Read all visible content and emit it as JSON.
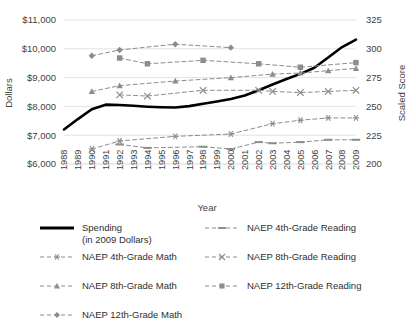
{
  "chart_data": {
    "type": "line",
    "title": "",
    "xlabel": "Year",
    "ylabel": "Dollars",
    "y2label": "Scaled Score",
    "grid": true,
    "legend_position": "bottom",
    "x": [
      1988,
      1989,
      1990,
      1991,
      1992,
      1993,
      1994,
      1995,
      1996,
      1997,
      1998,
      1999,
      2000,
      2001,
      2002,
      2003,
      2004,
      2005,
      2006,
      2007,
      2008,
      2009
    ],
    "xtick_labels": [
      "1988",
      "1989",
      "1990",
      "1991",
      "1992",
      "1993",
      "1994",
      "1995",
      "1996",
      "1997",
      "1998",
      "1999",
      "2000",
      "2001",
      "2002",
      "2003",
      "2004",
      "2005",
      "2006",
      "2007",
      "2008",
      "2009"
    ],
    "ylim": [
      6000,
      11000
    ],
    "ytick_values": [
      6000,
      7000,
      8000,
      9000,
      10000,
      11000
    ],
    "ytick_labels": [
      "$6,000",
      "$7,000",
      "$8,000",
      "$9,000",
      "$10,000",
      "$11,000"
    ],
    "y2lim": [
      200,
      325
    ],
    "y2tick_values": [
      200,
      225,
      250,
      275,
      300,
      325
    ],
    "y2tick_labels": [
      "200",
      "225",
      "250",
      "275",
      "300",
      "325"
    ],
    "series": [
      {
        "name": "Spending",
        "legend_label": "Spending",
        "legend_sublabel": "(in 2009 Dollars)",
        "axis": "left",
        "unit": "dollars",
        "style": "solid",
        "marker": "none",
        "color": "#000000",
        "width": 2.6,
        "points": [
          {
            "x": 1988,
            "y": 7200
          },
          {
            "x": 1989,
            "y": 7560
          },
          {
            "x": 1990,
            "y": 7900
          },
          {
            "x": 1991,
            "y": 8060
          },
          {
            "x": 1992,
            "y": 8050
          },
          {
            "x": 1993,
            "y": 8020
          },
          {
            "x": 1994,
            "y": 7990
          },
          {
            "x": 1995,
            "y": 7970
          },
          {
            "x": 1996,
            "y": 7960
          },
          {
            "x": 1997,
            "y": 8010
          },
          {
            "x": 1998,
            "y": 8090
          },
          {
            "x": 1999,
            "y": 8170
          },
          {
            "x": 2000,
            "y": 8260
          },
          {
            "x": 2001,
            "y": 8380
          },
          {
            "x": 2002,
            "y": 8560
          },
          {
            "x": 2003,
            "y": 8760
          },
          {
            "x": 2004,
            "y": 8950
          },
          {
            "x": 2005,
            "y": 9130
          },
          {
            "x": 2006,
            "y": 9340
          },
          {
            "x": 2007,
            "y": 9700
          },
          {
            "x": 2008,
            "y": 10060
          },
          {
            "x": 2009,
            "y": 10320
          }
        ]
      },
      {
        "name": "NAEP 12th-Grade Math",
        "legend_label": "NAEP 12th-Grade Math",
        "axis": "right",
        "unit": "score",
        "style": "dashed",
        "marker": "diamond",
        "color": "#8c8c8c",
        "width": 1,
        "points": [
          {
            "x": 1990,
            "y": 294
          },
          {
            "x": 1992,
            "y": 299
          },
          {
            "x": 1996,
            "y": 304
          },
          {
            "x": 2000,
            "y": 301
          }
        ]
      },
      {
        "name": "NAEP 12th-Grade Reading",
        "legend_label": "NAEP 12th-Grade Reading",
        "axis": "right",
        "unit": "score",
        "style": "dashed",
        "marker": "square",
        "color": "#8c8c8c",
        "width": 1,
        "points": [
          {
            "x": 1992,
            "y": 292
          },
          {
            "x": 1994,
            "y": 287
          },
          {
            "x": 1998,
            "y": 290
          },
          {
            "x": 2002,
            "y": 287
          },
          {
            "x": 2005,
            "y": 284
          },
          {
            "x": 2009,
            "y": 288
          }
        ]
      },
      {
        "name": "NAEP 8th-Grade Math",
        "legend_label": "NAEP 8th-Grade Math",
        "axis": "right",
        "unit": "score",
        "style": "dashed",
        "marker": "triangle",
        "color": "#8c8c8c",
        "width": 1,
        "points": [
          {
            "x": 1990,
            "y": 263
          },
          {
            "x": 1992,
            "y": 268
          },
          {
            "x": 1996,
            "y": 272
          },
          {
            "x": 2000,
            "y": 275
          },
          {
            "x": 2003,
            "y": 278
          },
          {
            "x": 2005,
            "y": 279
          },
          {
            "x": 2007,
            "y": 281
          },
          {
            "x": 2009,
            "y": 283
          }
        ]
      },
      {
        "name": "NAEP 8th-Grade Reading",
        "legend_label": "NAEP 8th-Grade Reading",
        "axis": "right",
        "unit": "score",
        "style": "dashed",
        "marker": "x",
        "color": "#8c8c8c",
        "width": 1,
        "points": [
          {
            "x": 1992,
            "y": 260
          },
          {
            "x": 1994,
            "y": 259
          },
          {
            "x": 1998,
            "y": 264
          },
          {
            "x": 2002,
            "y": 264
          },
          {
            "x": 2003,
            "y": 263
          },
          {
            "x": 2005,
            "y": 262
          },
          {
            "x": 2007,
            "y": 263
          },
          {
            "x": 2009,
            "y": 264
          }
        ]
      },
      {
        "name": "NAEP 4th-Grade Math",
        "legend_label": "NAEP 4th-Grade Math",
        "axis": "right",
        "unit": "score",
        "style": "dashed",
        "marker": "asterisk",
        "color": "#8c8c8c",
        "width": 1,
        "points": [
          {
            "x": 1990,
            "y": 213
          },
          {
            "x": 1992,
            "y": 220
          },
          {
            "x": 1996,
            "y": 224
          },
          {
            "x": 2000,
            "y": 226
          },
          {
            "x": 2003,
            "y": 235
          },
          {
            "x": 2005,
            "y": 238
          },
          {
            "x": 2007,
            "y": 240
          },
          {
            "x": 2009,
            "y": 240
          }
        ]
      },
      {
        "name": "NAEP 4th-Grade Reading",
        "legend_label": "NAEP 4th-Grade Reading",
        "axis": "right",
        "unit": "score",
        "style": "dashed",
        "marker": "dash",
        "color": "#8c8c8c",
        "width": 1,
        "points": [
          {
            "x": 1992,
            "y": 217
          },
          {
            "x": 1994,
            "y": 214
          },
          {
            "x": 1998,
            "y": 215
          },
          {
            "x": 2000,
            "y": 213
          },
          {
            "x": 2002,
            "y": 219
          },
          {
            "x": 2003,
            "y": 218
          },
          {
            "x": 2005,
            "y": 219
          },
          {
            "x": 2007,
            "y": 221
          },
          {
            "x": 2009,
            "y": 221
          }
        ]
      }
    ]
  },
  "legend": {
    "column_left": [
      {
        "key": "spending",
        "label": "Spending",
        "sublabel": "(in 2009 Dollars)",
        "marker": "none",
        "style": "solid"
      },
      {
        "key": "naep-4th-math",
        "label": "NAEP 4th-Grade Math",
        "marker": "asterisk",
        "style": "dashed"
      },
      {
        "key": "naep-8th-math",
        "label": "NAEP 8th-Grade Math",
        "marker": "triangle",
        "style": "dashed"
      },
      {
        "key": "naep-12th-math",
        "label": "NAEP 12th-Grade Math",
        "marker": "diamond",
        "style": "dashed"
      }
    ],
    "column_right": [
      {
        "key": "naep-4th-reading",
        "label": "NAEP 4th-Grade Reading",
        "marker": "dash",
        "style": "dashed"
      },
      {
        "key": "naep-8th-reading",
        "label": "NAEP 8th-Grade Reading",
        "marker": "x",
        "style": "dashed"
      },
      {
        "key": "naep-12th-reading",
        "label": "NAEP 12th-Grade Reading",
        "marker": "square",
        "style": "dashed"
      }
    ]
  },
  "colors": {
    "spending_line": "#000000",
    "naep_lines": "#8c8c8c",
    "gridline": "#e3e3e3",
    "text": "#3f3f3f",
    "background": "#ffffff"
  }
}
